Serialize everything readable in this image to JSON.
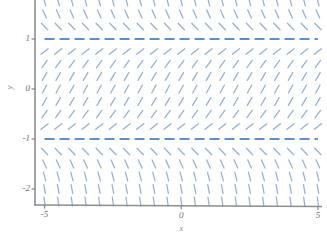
{
  "chart_data": {
    "type": "line",
    "title": "",
    "xlabel": "x",
    "ylabel": "y",
    "grid": false,
    "legend": "none",
    "xlim": [
      -5.35,
      5.15
    ],
    "ylim": [
      -2.32,
      1.82
    ],
    "xticks": [
      -5,
      0,
      5
    ],
    "xticklabels": [
      "-5",
      "0",
      "5"
    ],
    "yticks": [
      1,
      0,
      -1,
      -2
    ],
    "yticklabels": [
      "1",
      "0",
      "-1",
      "-2"
    ],
    "series": [
      {
        "name": "equilibrium solution y = 1",
        "style": "dashed",
        "color": "#5f8fc6",
        "y": 1,
        "x": [
          -5,
          5
        ]
      },
      {
        "name": "equilibrium solution y = -1",
        "style": "dashed",
        "color": "#5f8fc6",
        "y": -1,
        "x": [
          -5,
          5
        ]
      }
    ],
    "vector_field": {
      "name": "slope segments",
      "color": "#7c9fce",
      "x_start": -5.0,
      "x_end": 5.0,
      "x_step": 0.5,
      "y_start": -2.25,
      "y_end": 1.75,
      "y_step": 0.25,
      "slope_formula": "dy/dx = 1 - y^2",
      "segment_length_px": 9,
      "notes": "Slopes are positive (up-right) for -1 < y < 1, negative (down-right) for |y| > 1, and horizontal on y = 1 and y = -1."
    },
    "colors": {
      "field": "#7c9fce",
      "equilibrium": "#5f8fc6",
      "axis": "#8d8d8d",
      "tick_text": "#6e6e6e",
      "background": "#ffffff"
    }
  },
  "axes": {
    "x_axis_name": "x-axis",
    "y_axis_name": "y-axis",
    "x_title": "x",
    "y_title": "y"
  }
}
